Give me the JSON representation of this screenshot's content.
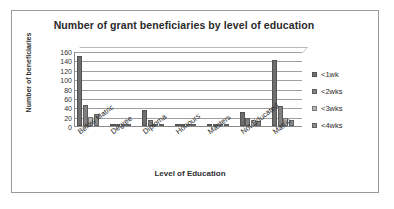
{
  "chart_data": {
    "type": "bar",
    "title": "Number of grant beneficiaries by level of education",
    "xlabel": "Level of Education",
    "ylabel": "Number of beneficiaries",
    "ylim": [
      0,
      160
    ],
    "ytick_step": 20,
    "yticks": [
      "160",
      "140",
      "120",
      "100",
      "80",
      "60",
      "40",
      "20",
      "0"
    ],
    "grid": true,
    "legend_position": "right",
    "categories": [
      "Below Matric",
      "Degree",
      "Diploma",
      "Honours",
      "Masters",
      "Not Educated",
      "Matric"
    ],
    "series": [
      {
        "name": "<1wk",
        "color": "#6e6e6e",
        "values": [
          150,
          4,
          35,
          3,
          2,
          30,
          140
        ]
      },
      {
        "name": "<2wks",
        "color": "#808080",
        "values": [
          45,
          3,
          12,
          3,
          2,
          18,
          42
        ]
      },
      {
        "name": "<3wks",
        "color": "#b5b5b5",
        "values": [
          20,
          2,
          5,
          2,
          2,
          12,
          18
        ]
      },
      {
        "name": "<4wks",
        "color": "#8a8a8a",
        "values": [
          25,
          2,
          4,
          2,
          2,
          10,
          12
        ]
      }
    ]
  },
  "frame": {
    "border_color": "#9a9a9a",
    "background": "#ffffff"
  }
}
